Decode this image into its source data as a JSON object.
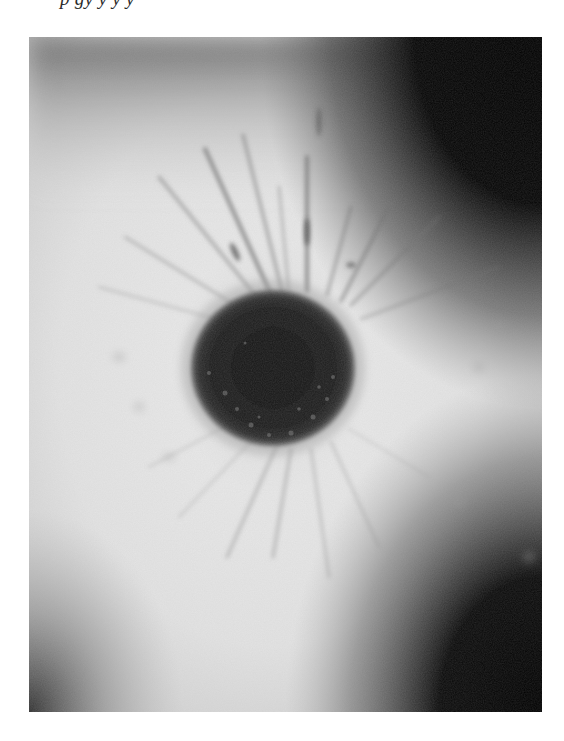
{
  "page": {
    "caption_fragment": "p              gy y                    y           y",
    "caption_note": "top line of italic caption text clipped at page edge; glyph tops not visible"
  },
  "figure": {
    "colors": {
      "background": "#ffffff",
      "iris_light": "#e6e6e6",
      "iris_mid": "#bdbdbd",
      "pupil": "#161616",
      "corner_dark": "#050505"
    },
    "pupil": {
      "center_x": 273,
      "center_y": 368,
      "radius_x": 82,
      "radius_y": 78
    }
  }
}
